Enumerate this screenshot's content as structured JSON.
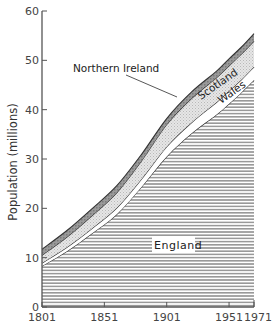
{
  "chart_data": {
    "type": "area",
    "stacked": true,
    "title": "",
    "xlabel": "",
    "ylabel": "Population (millions)",
    "xlim": [
      1801,
      1971
    ],
    "ylim": [
      0,
      60
    ],
    "x_ticks": [
      1801,
      1851,
      1901,
      1951,
      1971
    ],
    "y_ticks": [
      0,
      10,
      20,
      30,
      40,
      50,
      60
    ],
    "grid": false,
    "x": [
      1801,
      1821,
      1841,
      1861,
      1881,
      1901,
      1921,
      1941,
      1951,
      1961,
      1971
    ],
    "series": [
      {
        "name": "England",
        "pattern": "horizontal-lines",
        "values": [
          8.3,
          11.3,
          14.9,
          18.8,
          24.4,
          30.5,
          35.2,
          39.0,
          41.2,
          43.5,
          46.0
        ]
      },
      {
        "name": "Wales",
        "pattern": "white",
        "values": [
          0.6,
          0.8,
          1.0,
          1.3,
          1.6,
          2.0,
          2.2,
          2.5,
          2.6,
          2.6,
          2.7
        ]
      },
      {
        "name": "Scotland",
        "pattern": "light-stipple",
        "values": [
          1.6,
          2.1,
          2.6,
          3.1,
          3.7,
          4.5,
          4.9,
          5.0,
          5.1,
          5.2,
          5.2
        ]
      },
      {
        "name": "Northern Ireland",
        "pattern": "dark-hatch",
        "values": [
          1.2,
          1.3,
          1.4,
          1.4,
          1.3,
          1.2,
          1.3,
          1.3,
          1.4,
          1.4,
          1.5
        ]
      }
    ],
    "labels": {
      "england": "England",
      "wales": "Wales",
      "scotland": "Scotland",
      "northern_ireland": "Northern Ireland"
    }
  }
}
